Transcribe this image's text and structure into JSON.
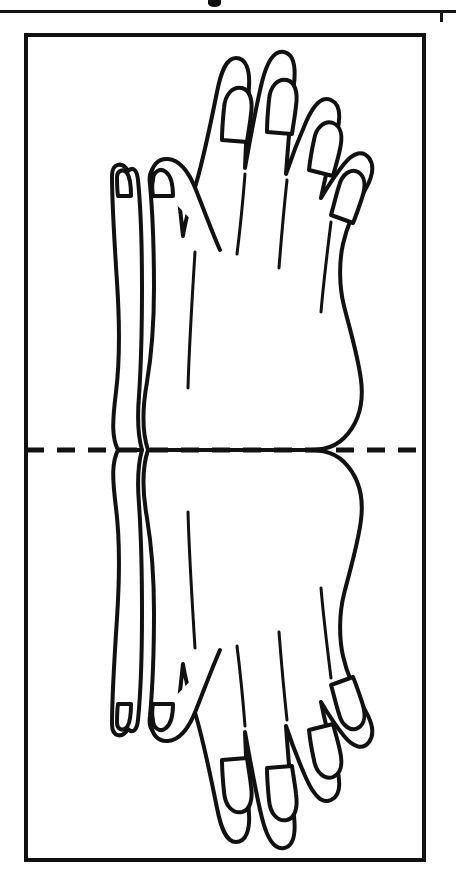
{
  "page": {
    "background_color": "#ffffff",
    "ink_color": "#111111",
    "width": 456,
    "height": 892
  },
  "partial_header": {
    "description": "cropped remnant of a caption line from the page above",
    "rule_label": "page-rule",
    "mark_label": "descender-mark"
  },
  "frame": {
    "label": "template-border",
    "x": 26,
    "y": 35,
    "width": 398,
    "height": 825,
    "stroke_width": 4,
    "color": "#111111"
  },
  "fold_line": {
    "label": "fold-here-dashed-line",
    "y": 450,
    "x_start": 26,
    "x_end": 424,
    "dash_length": 18,
    "gap_length": 13,
    "stroke_width": 5,
    "color": "#111111"
  },
  "artwork": {
    "subject": "pair of mirrored hands",
    "style": "black outline line art, no fill",
    "symmetry": "vertical mirror about the dashed fold line",
    "stroke_color": "#111111",
    "fill_color": "#ffffff",
    "halves": [
      {
        "label": "upper-hand",
        "position": "above fold line"
      },
      {
        "label": "lower-hand",
        "position": "below fold line, mirrored"
      }
    ],
    "parts": [
      {
        "label": "index-finger",
        "nail": true
      },
      {
        "label": "middle-finger",
        "nail": true
      },
      {
        "label": "ring-finger",
        "nail": true
      },
      {
        "label": "little-finger",
        "nail": true
      },
      {
        "label": "thumb",
        "nail": true
      },
      {
        "label": "second-hand-thumb",
        "nail": true
      },
      {
        "label": "wrist",
        "nail": false
      },
      {
        "label": "knuckle-creases",
        "nail": false
      }
    ],
    "nail_count_per_half": 6,
    "crease_count_per_half": 3
  }
}
